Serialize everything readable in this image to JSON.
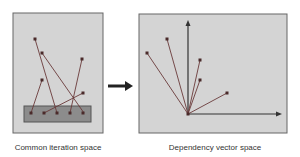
{
  "diagram": {
    "left_panel": {
      "caption": "Common iteration space",
      "bg": "#d4d4d4",
      "box_fill": "#8c8c8c",
      "box": {
        "x": 24,
        "y": 106,
        "w": 67,
        "h": 16
      },
      "box_points": [
        [
          31,
          113
        ],
        [
          44,
          113
        ],
        [
          57,
          113
        ],
        [
          70,
          113
        ],
        [
          83,
          113
        ]
      ],
      "edges": [
        {
          "from": [
            35,
            39
          ],
          "to": [
            57,
            113
          ]
        },
        {
          "from": [
            42,
            53
          ],
          "to": [
            84,
            113
          ]
        },
        {
          "from": [
            82,
            59
          ],
          "to": [
            70,
            113
          ]
        },
        {
          "from": [
            42,
            80
          ],
          "to": [
            31,
            113
          ]
        },
        {
          "from": [
            83,
            93
          ],
          "to": [
            44,
            113
          ]
        }
      ]
    },
    "arrow": {
      "from": [
        108,
        86
      ],
      "to": [
        132,
        86
      ]
    },
    "right_panel": {
      "caption": "Dependency vector space",
      "bg": "#d4d4d4",
      "origin": [
        188,
        114
      ],
      "y_axis_end": [
        188,
        23
      ],
      "x_axis_end": [
        279,
        114
      ],
      "vectors": [
        [
          147,
          53
        ],
        [
          167,
          39
        ],
        [
          200,
          60
        ],
        [
          200,
          80
        ],
        [
          227,
          93
        ]
      ]
    },
    "line_color": "#6a3a3a",
    "dot_color": "#4a2a2a"
  }
}
